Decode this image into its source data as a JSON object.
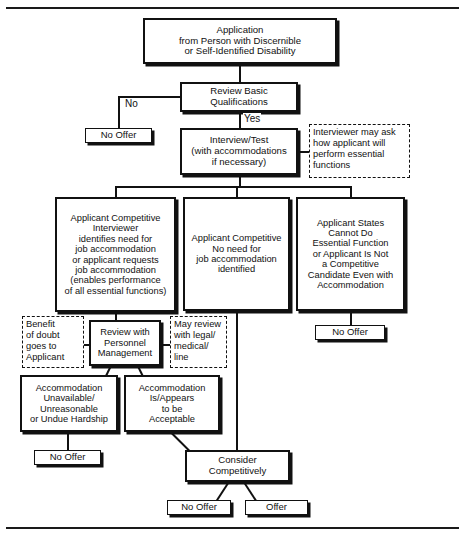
{
  "document": {
    "title": "Application from Person with Discernible or Self-Identified Disability",
    "type": "flowchart",
    "header_rule": "",
    "footer_rule": ""
  },
  "nodes": {
    "application": {
      "line1": "Application",
      "line2": "from Person with Discernible",
      "line3": "or Self-Identified Disability"
    },
    "review_basic": {
      "line1": "Review Basic",
      "line2": "Qualifications"
    },
    "no_offer_review": {
      "label": "No Offer"
    },
    "interview": {
      "line1": "Interview/Test",
      "line2": "(with accommodations",
      "line3": "if necessary)"
    },
    "branch_left": {
      "line1": "Applicant Competitive",
      "line2": "Interviewer",
      "line3": "identifies need for",
      "line4": "job accommodation",
      "line5": "or applicant requests",
      "line6": "job accommodation",
      "line7": "(enables performance",
      "line8": "of all essential functions)"
    },
    "branch_middle": {
      "line1": "Applicant Competitive",
      "line2": "No need for",
      "line3": "job accommodation",
      "line4": "identified"
    },
    "branch_right": {
      "line1": "Applicant States",
      "line2": "Cannot Do",
      "line3": "Essential Function",
      "line4": "or Applicant Is Not",
      "line5": "a Competitive",
      "line6": "Candidate Even with",
      "line7": "Accommodation"
    },
    "no_offer_right": {
      "label": "No Offer"
    },
    "review_personnel": {
      "line1": "Review with",
      "line2": "Personnel",
      "line3": "Management"
    },
    "accommodation_unavailable": {
      "line1": "Accommodation",
      "line2": "Unavailable/",
      "line3": "Unreasonable",
      "line4": "or Undue Hardship"
    },
    "accommodation_acceptable": {
      "line1": "Accommodation",
      "line2": "Is/Appears",
      "line3": "to be",
      "line4": "Acceptable"
    },
    "no_offer_unavailable": {
      "label": "No Offer"
    },
    "consider_competitively": {
      "line1": "Consider",
      "line2": "Competitively"
    },
    "final_no_offer": {
      "label": "No Offer"
    },
    "final_offer": {
      "label": "Offer"
    }
  },
  "notes": {
    "interviewer_may_ask": {
      "line1": "Interviewer may ask",
      "line2": "how applicant will",
      "line3": "perform essential",
      "line4": "functions"
    },
    "benefit_of_doubt": {
      "line1": "Benefit",
      "line2": "of doubt",
      "line3": "goes to",
      "line4": "Applicant"
    },
    "may_review": {
      "line1": "May review",
      "line2": "with legal/",
      "line3": "medical/",
      "line4": "line"
    }
  },
  "edge_labels": {
    "no": "No",
    "yes": "Yes"
  },
  "colors": {
    "ink": "#111111",
    "paper": "#ffffff",
    "rule": "#1a1a1a"
  }
}
